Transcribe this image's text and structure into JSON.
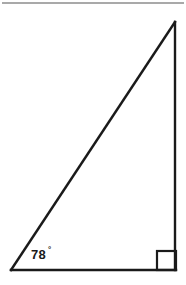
{
  "figure": {
    "type": "right-triangle-diagram",
    "background_color": "#ffffff",
    "stroke_color": "#1a1a1a",
    "top_rule_color": "#8c8c8c",
    "labels": {
      "angle_value": "78",
      "angle_degree_symbol": "°",
      "angle_full": "78°"
    },
    "geometry": {
      "left_vertex": [
        11,
        270
      ],
      "right_vertex": [
        176,
        270
      ],
      "apex_vertex": [
        175,
        22
      ],
      "right_angle_marker": {
        "x": 157,
        "y": 251,
        "size": 19
      },
      "top_rule": {
        "x1": 2,
        "y1": 3,
        "x2": 184,
        "y2": 3
      }
    }
  }
}
